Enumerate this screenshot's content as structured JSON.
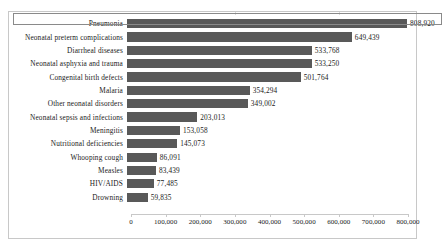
{
  "chart_data": {
    "type": "bar",
    "orientation": "horizontal",
    "title": "",
    "xlabel": "",
    "ylabel": "",
    "xlim": [
      0,
      800000
    ],
    "grid": false,
    "legend": null,
    "bar_color": "#595959",
    "selected_category": "Pneumonia",
    "categories": [
      "Pneumonia",
      "Neonatal preterm complications",
      "Diarrheal diseases",
      "Neonatal asphyxia and trauma",
      "Congenital birth defects",
      "Malaria",
      "Other neonatal disorders",
      "Neonatal sepsis and infections",
      "Meningitis",
      "Nutritional deficiencies",
      "Whooping cough",
      "Measles",
      "HIV/AIDS",
      "Drowning"
    ],
    "values": [
      808920,
      649439,
      533768,
      533250,
      501764,
      354294,
      349002,
      203013,
      153058,
      145073,
      86091,
      83439,
      77485,
      59835
    ],
    "value_labels": [
      "808,920",
      "649,439",
      "533,768",
      "533,250",
      "501,764",
      "354,294",
      "349,002",
      "203,013",
      "153,058",
      "145,073",
      "86,091",
      "83,439",
      "77,485",
      "59,835"
    ],
    "xticks": [
      0,
      100000,
      200000,
      300000,
      400000,
      500000,
      600000,
      700000,
      800000
    ],
    "xtick_labels": [
      "0",
      "100,000",
      "200,000",
      "300,000",
      "400,000",
      "500,000",
      "600,000",
      "700,000",
      "800,000"
    ]
  }
}
